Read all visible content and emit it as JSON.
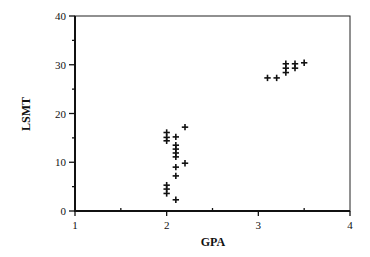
{
  "chart_data": {
    "type": "scatter",
    "title": "",
    "xlabel": "GPA",
    "ylabel": "LSMT",
    "xlim": [
      1,
      4
    ],
    "ylim": [
      0,
      40
    ],
    "xticks": [
      1,
      2,
      3,
      4
    ],
    "yticks": [
      0,
      10,
      20,
      30,
      40
    ],
    "x_minor_ticks": [
      1.5,
      2.5,
      3.5
    ],
    "y_minor_ticks": [
      5,
      15,
      25,
      35
    ],
    "grid": false,
    "legend": null,
    "marker": "+",
    "series": [
      {
        "name": "students",
        "points": [
          {
            "x": 2.0,
            "y": 16.1
          },
          {
            "x": 2.0,
            "y": 15.1
          },
          {
            "x": 2.0,
            "y": 14.4
          },
          {
            "x": 2.0,
            "y": 5.3
          },
          {
            "x": 2.0,
            "y": 4.5
          },
          {
            "x": 2.0,
            "y": 3.6
          },
          {
            "x": 2.1,
            "y": 15.2
          },
          {
            "x": 2.1,
            "y": 13.5
          },
          {
            "x": 2.1,
            "y": 12.7
          },
          {
            "x": 2.1,
            "y": 11.9
          },
          {
            "x": 2.1,
            "y": 11.1
          },
          {
            "x": 2.1,
            "y": 9.0
          },
          {
            "x": 2.1,
            "y": 7.2
          },
          {
            "x": 2.1,
            "y": 2.3
          },
          {
            "x": 2.2,
            "y": 17.2
          },
          {
            "x": 2.2,
            "y": 9.8
          },
          {
            "x": 3.1,
            "y": 27.3
          },
          {
            "x": 3.2,
            "y": 27.3
          },
          {
            "x": 3.3,
            "y": 30.2
          },
          {
            "x": 3.3,
            "y": 29.3
          },
          {
            "x": 3.3,
            "y": 28.4
          },
          {
            "x": 3.4,
            "y": 30.2
          },
          {
            "x": 3.4,
            "y": 29.3
          },
          {
            "x": 3.5,
            "y": 30.4
          }
        ]
      }
    ]
  },
  "labels": {
    "x_axis_title": "GPA",
    "y_axis_title": "LSMT"
  }
}
